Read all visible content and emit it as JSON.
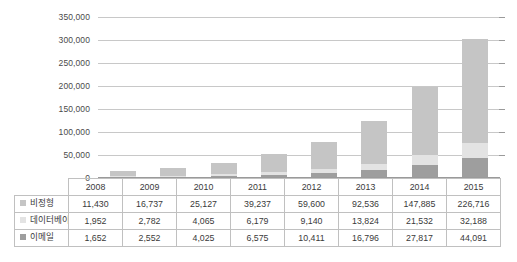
{
  "chart_data": {
    "type": "bar",
    "stacked": true,
    "title": "",
    "subtitle": "",
    "xlabel": "",
    "ylabel": "",
    "categories": [
      "2008",
      "2009",
      "2010",
      "2011",
      "2012",
      "2013",
      "2014",
      "2015"
    ],
    "series": [
      {
        "name": "이메일",
        "color": "#9e9e9e",
        "stack_order": 1,
        "values": [
          1652,
          2552,
          4025,
          6575,
          10411,
          16796,
          27817,
          44091
        ]
      },
      {
        "name": "데이터베이스",
        "color": "#e3e3e3",
        "stack_order": 2,
        "values": [
          1952,
          2782,
          4065,
          6179,
          9140,
          13824,
          21532,
          32188
        ]
      },
      {
        "name": "비정형",
        "color": "#c5c5c5",
        "stack_order": 3,
        "values": [
          11430,
          16737,
          25127,
          39237,
          59600,
          92536,
          147885,
          226716
        ]
      }
    ],
    "ylim": [
      0,
      350000
    ],
    "ytick_values": [
      0,
      50000,
      100000,
      150000,
      200000,
      250000,
      300000,
      350000
    ],
    "ytick_labels": [
      "0",
      "50,000",
      "100,000",
      "150,000",
      "200,000",
      "250,000",
      "300,000",
      "350,000"
    ],
    "grid": true,
    "legend_position": "data-table-row-labels",
    "annotations": []
  },
  "table": {
    "corner_label": "",
    "header_row": [
      "2008",
      "2009",
      "2010",
      "2011",
      "2012",
      "2013",
      "2014",
      "2015"
    ],
    "rows": [
      {
        "label": "비정형",
        "swatch_color": "#c5c5c5",
        "values": [
          "11,430",
          "16,737",
          "25,127",
          "39,237",
          "59,600",
          "92,536",
          "147,885",
          "226,716"
        ]
      },
      {
        "label": "데이터베이스",
        "swatch_color": "#e3e3e3",
        "values": [
          "1,952",
          "2,782",
          "4,065",
          "6,179",
          "9,140",
          "13,824",
          "21,532",
          "32,188"
        ]
      },
      {
        "label": "이메일",
        "swatch_color": "#9e9e9e",
        "values": [
          "1,652",
          "2,552",
          "4,025",
          "6,575",
          "10,411",
          "16,796",
          "27,817",
          "44,091"
        ]
      }
    ]
  },
  "style": {
    "background": "#ffffff",
    "gridline_color": "#c8c8c8",
    "axis_color": "#9a9a9a",
    "border_color": "#c0c0c0",
    "text_color": "#3a3a3a"
  }
}
